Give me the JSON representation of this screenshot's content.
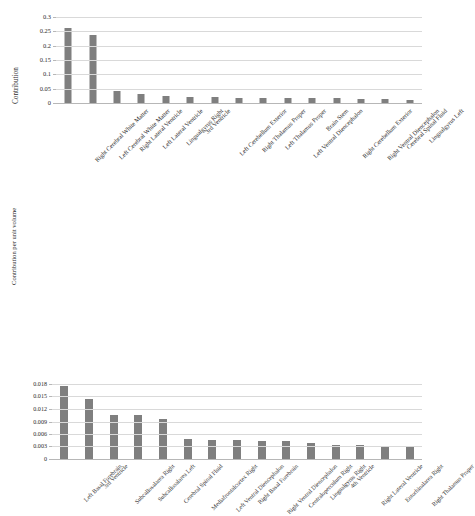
{
  "figure": {
    "background_color": "#ffffff",
    "bar_color": "#7f7f7f",
    "gridline_color": "#d9d9d9",
    "axis_color": "#b7b7b7"
  },
  "chart_data": [
    {
      "id": "contribution",
      "type": "bar",
      "title": "",
      "xlabel": "",
      "ylabel": "Contribution",
      "ylim": [
        0,
        0.3
      ],
      "yticks": [
        0,
        0.05,
        0.1,
        0.15,
        0.2,
        0.25,
        0.3
      ],
      "ytick_labels": [
        "0",
        "0.05",
        "0.1",
        "0.15",
        "0.2",
        "0.25",
        "0.3"
      ],
      "grid": true,
      "legend": "none",
      "categories": [
        "Right Cerebral White Matter",
        "Left Cerebral White Matter",
        "Right Lateral Ventricle",
        "Left Lateral Ventricle",
        "Lingualgyrus Right",
        "3rd Ventricle",
        "Left Cerebellum Exterior",
        "Right Thalamus Proper",
        "Left Thalamus Proper",
        "Left Ventral Diencephalon",
        "Brain Stem",
        "Right Cerebellum Exterior",
        "Right Ventral Diencephalon",
        "Cerebral Spinal Fluid",
        "Lingualgyrus Left"
      ],
      "values": [
        0.26,
        0.239,
        0.043,
        0.031,
        0.023,
        0.021,
        0.02,
        0.019,
        0.019,
        0.018,
        0.017,
        0.016,
        0.015,
        0.014,
        0.011
      ]
    },
    {
      "id": "contribution-per-unit-volume",
      "type": "bar",
      "title": "",
      "xlabel": "",
      "ylabel": "Contribution per unit volume",
      "ylim": [
        0,
        0.018
      ],
      "yticks": [
        0,
        0.003,
        0.006,
        0.009,
        0.012,
        0.015,
        0.018
      ],
      "ytick_labels": [
        "0",
        "0.003",
        "0.006",
        "0.009",
        "0.012",
        "0.015",
        "0.018"
      ],
      "grid": true,
      "legend": "none",
      "categories": [
        "Left Basal Forebrain",
        "3rd Ventricle",
        "Subcallosalarea Right",
        "Subcallosalarea Left",
        "Cerebral Spinal Fluid",
        "Mediafrontalcortex Right",
        "Left Ventral Diencephalon",
        "Right Basal Forebrain",
        "Right Ventral Diencephalon",
        "Centraloperculum Right",
        "Lingualgyrus Right",
        "4th Ventricle",
        "Right Lateral Ventricle",
        "Entorhinalarea Right",
        "Right Thalamus Proper"
      ],
      "values": [
        0.01745,
        0.01445,
        0.01055,
        0.01045,
        0.00955,
        0.00475,
        0.00468,
        0.00448,
        0.00442,
        0.00425,
        0.00385,
        0.00348,
        0.00345,
        0.00322,
        0.00312
      ]
    }
  ]
}
